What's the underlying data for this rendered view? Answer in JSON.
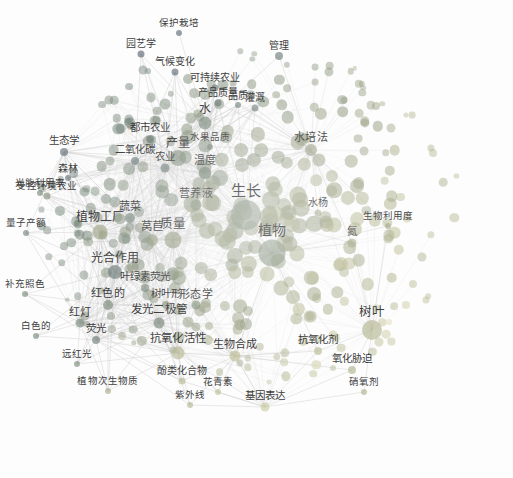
{
  "figure": {
    "type": "keyword-co-occurrence-network",
    "title": "",
    "background_color": "#fdfdfd",
    "node_opacity": 0.62,
    "edge_color": "#c9c9c9"
  },
  "legend": {
    "name": "year-overlay-colorbar",
    "unit_label": "（年份）",
    "ticks": [
      "2016",
      "2017",
      "2018",
      "2019"
    ],
    "tick_x": [
      188,
      234,
      281,
      325
    ],
    "gradient_stops": [
      "#4b4a63",
      "#5d6b74",
      "#869179",
      "#bcbd92",
      "#e8e6c6",
      "#fcfbf0"
    ],
    "range": [
      2016,
      2019
    ]
  },
  "chart_data": {
    "type": "scatter",
    "title": "",
    "xlabel": "",
    "ylabel": "",
    "colorbar": {
      "label": "（年份）",
      "min": 2016,
      "max": 2019
    },
    "nodes": [
      {
        "label": "生长",
        "x": 246,
        "y": 215,
        "size": 30,
        "year": 2017.5,
        "fs": 15
      },
      {
        "label": "植物",
        "x": 272,
        "y": 253,
        "size": 27,
        "year": 2017.6,
        "fs": 14
      },
      {
        "label": "光合作用",
        "x": 115,
        "y": 272,
        "size": 14,
        "year": 2016.9,
        "fs": 12
      },
      {
        "label": "质量",
        "x": 173,
        "y": 240,
        "size": 17,
        "year": 2017.9,
        "fs": 12.5
      },
      {
        "label": "产量",
        "x": 178,
        "y": 158,
        "size": 16,
        "year": 2017.6,
        "fs": 12
      },
      {
        "label": "树叶",
        "x": 372,
        "y": 330,
        "size": 20,
        "year": 2018.6,
        "fs": 12.5
      },
      {
        "label": "植物工厂",
        "x": 100,
        "y": 232,
        "size": 15,
        "year": 2018.2,
        "fs": 12
      },
      {
        "label": "水",
        "x": 205,
        "y": 123,
        "size": 13,
        "year": 2017.3,
        "fs": 12
      },
      {
        "label": "温度",
        "x": 205,
        "y": 173,
        "size": 12,
        "year": 2017.3,
        "fs": 11
      },
      {
        "label": "营养液",
        "x": 196,
        "y": 205,
        "size": 11,
        "year": 2017.7,
        "fs": 11
      },
      {
        "label": "水培法",
        "x": 311,
        "y": 150,
        "size": 12,
        "year": 2018.1,
        "fs": 11
      },
      {
        "label": "抗氧化活性",
        "x": 178,
        "y": 353,
        "size": 13,
        "year": 2018.7,
        "fs": 11.5
      },
      {
        "label": "生物合成",
        "x": 235,
        "y": 356,
        "size": 11,
        "year": 2018.8,
        "fs": 11
      },
      {
        "label": "基因表达",
        "x": 265,
        "y": 407,
        "size": 9,
        "year": 2018.9,
        "fs": 10.5
      },
      {
        "label": "发光二极管",
        "x": 159,
        "y": 323,
        "size": 11,
        "year": 2017.4,
        "fs": 11.5
      },
      {
        "label": "红色的",
        "x": 108,
        "y": 305,
        "size": 10,
        "year": 2017.5,
        "fs": 11
      },
      {
        "label": "红灯",
        "x": 80,
        "y": 323,
        "size": 9,
        "year": 2017.2,
        "fs": 11
      },
      {
        "label": "荧光",
        "x": 96,
        "y": 340,
        "size": 8,
        "year": 2017.1,
        "fs": 10.5
      },
      {
        "label": "莴苣",
        "x": 152,
        "y": 240,
        "size": 12,
        "year": 2018.0,
        "fs": 11.5
      },
      {
        "label": "蔬菜",
        "x": 130,
        "y": 218,
        "size": 10,
        "year": 2017.2,
        "fs": 11
      },
      {
        "label": "农业",
        "x": 165,
        "y": 168,
        "size": 9,
        "year": 2016.9,
        "fs": 10.5
      },
      {
        "label": "生态学",
        "x": 64,
        "y": 152,
        "size": 8,
        "year": 2016.6,
        "fs": 10.5
      },
      {
        "label": "二氧化碳",
        "x": 135,
        "y": 161,
        "size": 8,
        "year": 2016.8,
        "fs": 10.5
      },
      {
        "label": "都市农业",
        "x": 150,
        "y": 139,
        "size": 8,
        "year": 2017.0,
        "fs": 10.5
      },
      {
        "label": "气候变化",
        "x": 175,
        "y": 72,
        "size": 7,
        "year": 2016.5,
        "fs": 10
      },
      {
        "label": "园艺学",
        "x": 141,
        "y": 54,
        "size": 7,
        "year": 2016.4,
        "fs": 10
      },
      {
        "label": "保护栽培",
        "x": 179,
        "y": 33,
        "size": 6,
        "year": 2016.5,
        "fs": 9.5
      },
      {
        "label": "可持续农业",
        "x": 215,
        "y": 88,
        "size": 7,
        "year": 2016.8,
        "fs": 10
      },
      {
        "label": "产品质量",
        "x": 218,
        "y": 103,
        "size": 7,
        "year": 2017.0,
        "fs": 10
      },
      {
        "label": "管理",
        "x": 279,
        "y": 56,
        "size": 8,
        "year": 2017.0,
        "fs": 10
      },
      {
        "label": "形态学",
        "x": 196,
        "y": 305,
        "size": 9,
        "year": 2017.6,
        "fs": 11
      },
      {
        "label": "树叶形",
        "x": 166,
        "y": 305,
        "size": 8,
        "year": 2017.8,
        "fs": 10.5
      },
      {
        "label": "叶绿素荧光",
        "x": 145,
        "y": 288,
        "size": 8,
        "year": 2017.3,
        "fs": 10.5
      },
      {
        "label": "受控环境农业",
        "x": 47,
        "y": 196,
        "size": 7,
        "year": 2017.7,
        "fs": 9.5
      },
      {
        "label": "光能利用率",
        "x": 40,
        "y": 193,
        "size": 6,
        "year": 2017.4,
        "fs": 9.5
      },
      {
        "label": "量子产额",
        "x": 26,
        "y": 233,
        "size": 6,
        "year": 2017.2,
        "fs": 9.5
      },
      {
        "label": "补充照色",
        "x": 25,
        "y": 294,
        "size": 6,
        "year": 2017.4,
        "fs": 9.5
      },
      {
        "label": "白色的",
        "x": 36,
        "y": 336,
        "size": 6,
        "year": 2017.3,
        "fs": 9.5
      },
      {
        "label": "远红光",
        "x": 77,
        "y": 364,
        "size": 6,
        "year": 2017.5,
        "fs": 9.5
      },
      {
        "label": "植物次生物质",
        "x": 108,
        "y": 391,
        "size": 6,
        "year": 2018.4,
        "fs": 9.5
      },
      {
        "label": "酚类化合物",
        "x": 182,
        "y": 381,
        "size": 7,
        "year": 2018.7,
        "fs": 10
      },
      {
        "label": "花青素",
        "x": 218,
        "y": 392,
        "size": 6,
        "year": 2018.8,
        "fs": 9.5
      },
      {
        "label": "紫外线",
        "x": 190,
        "y": 405,
        "size": 6,
        "year": 2018.6,
        "fs": 9.5
      },
      {
        "label": "抗氧化剂",
        "x": 318,
        "y": 351,
        "size": 8,
        "year": 2018.7,
        "fs": 10.5
      },
      {
        "label": "氧化胁迫",
        "x": 352,
        "y": 370,
        "size": 8,
        "year": 2018.6,
        "fs": 10.5
      },
      {
        "label": "硝氧剂",
        "x": 364,
        "y": 392,
        "size": 6,
        "year": 2018.5,
        "fs": 9.5
      },
      {
        "label": "生物利用度",
        "x": 388,
        "y": 226,
        "size": 6,
        "year": 2018.3,
        "fs": 9.5
      },
      {
        "label": "水杨",
        "x": 318,
        "y": 213,
        "size": 7,
        "year": 2018.2,
        "fs": 10
      },
      {
        "label": "灌溉",
        "x": 255,
        "y": 108,
        "size": 7,
        "year": 2017.1,
        "fs": 10
      },
      {
        "label": "氮",
        "x": 352,
        "y": 243,
        "size": 9,
        "year": 2018.3,
        "fs": 10.5
      },
      {
        "label": "森林",
        "x": 68,
        "y": 178,
        "size": 6,
        "year": 2016.7,
        "fs": 10
      },
      {
        "label": "品质",
        "x": 238,
        "y": 105,
        "size": 6,
        "year": 2017.2,
        "fs": 10
      },
      {
        "label": "水果品质",
        "x": 210,
        "y": 147,
        "size": 6,
        "year": 2017.4,
        "fs": 9.5
      }
    ],
    "note": "Node size encodes keyword occurrence count; node colour encodes average publication year per the 2016-2019 colorbar."
  }
}
